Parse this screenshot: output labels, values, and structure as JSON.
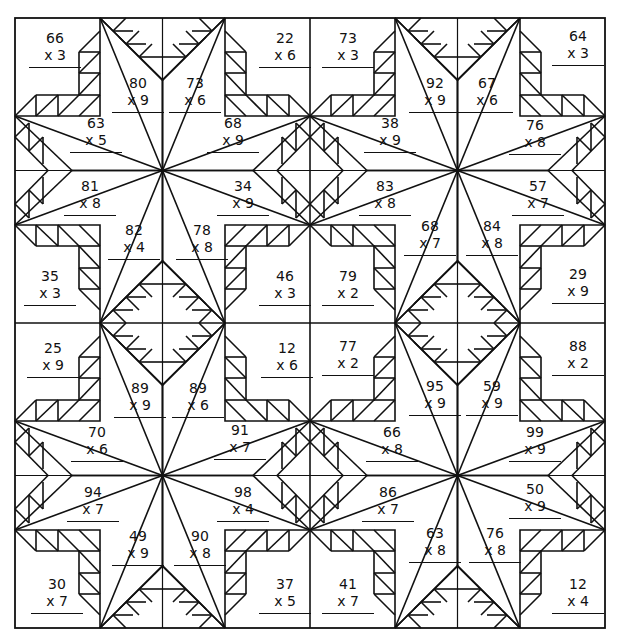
{
  "worksheet": {
    "type": "multiplication color-by-number quilt",
    "problems": [
      {
        "id": "q1-a",
        "n": "66",
        "m": "x 3",
        "x": 25,
        "y": 30
      },
      {
        "id": "q1-b",
        "n": "80",
        "m": "x 9",
        "x": 108,
        "y": 75
      },
      {
        "id": "q1-c",
        "n": "73",
        "m": "x 6",
        "x": 165,
        "y": 75
      },
      {
        "id": "q1-d",
        "n": "22",
        "m": "x 6",
        "x": 255,
        "y": 30
      },
      {
        "id": "q1-e",
        "n": "63",
        "m": "x 5",
        "x": 66,
        "y": 115
      },
      {
        "id": "q1-f",
        "n": "68",
        "m": "x 9",
        "x": 203,
        "y": 115
      },
      {
        "id": "q1-g",
        "n": "81",
        "m": "x 8",
        "x": 60,
        "y": 178
      },
      {
        "id": "q1-h",
        "n": "34",
        "m": "x 9",
        "x": 213,
        "y": 178
      },
      {
        "id": "q1-i",
        "n": "82",
        "m": "x 4",
        "x": 104,
        "y": 222
      },
      {
        "id": "q1-j",
        "n": "78",
        "m": "x 8",
        "x": 172,
        "y": 222
      },
      {
        "id": "q1-k",
        "n": "35",
        "m": "x 3",
        "x": 20,
        "y": 268
      },
      {
        "id": "q1-l",
        "n": "46",
        "m": "x 3",
        "x": 255,
        "y": 268
      },
      {
        "id": "q2-a",
        "n": "73",
        "m": "x 3",
        "x": 318,
        "y": 30
      },
      {
        "id": "q2-b",
        "n": "92",
        "m": "x 9",
        "x": 405,
        "y": 75
      },
      {
        "id": "q2-c",
        "n": "67",
        "m": "x 6",
        "x": 457,
        "y": 75
      },
      {
        "id": "q2-d",
        "n": "64",
        "m": "x 3",
        "x": 548,
        "y": 28
      },
      {
        "id": "q2-e",
        "n": "38",
        "m": "x 9",
        "x": 360,
        "y": 115
      },
      {
        "id": "q2-f",
        "n": "76",
        "m": "x 8",
        "x": 505,
        "y": 117
      },
      {
        "id": "q2-g",
        "n": "83",
        "m": "x 8",
        "x": 355,
        "y": 178
      },
      {
        "id": "q2-h",
        "n": "57",
        "m": "x 7",
        "x": 508,
        "y": 178
      },
      {
        "id": "q2-i",
        "n": "68",
        "m": "x 7",
        "x": 400,
        "y": 218
      },
      {
        "id": "q2-j",
        "n": "84",
        "m": "x 8",
        "x": 462,
        "y": 218
      },
      {
        "id": "q2-k",
        "n": "79",
        "m": "x 2",
        "x": 318,
        "y": 268
      },
      {
        "id": "q2-l",
        "n": "29",
        "m": "x 9",
        "x": 548,
        "y": 266
      },
      {
        "id": "q3-a",
        "n": "25",
        "m": "x 9",
        "x": 23,
        "y": 340
      },
      {
        "id": "q3-b",
        "n": "89",
        "m": "x 9",
        "x": 110,
        "y": 380
      },
      {
        "id": "q3-c",
        "n": "89",
        "m": "x 6",
        "x": 168,
        "y": 380
      },
      {
        "id": "q3-d",
        "n": "12",
        "m": "x 6",
        "x": 257,
        "y": 340
      },
      {
        "id": "q3-e",
        "n": "70",
        "m": "x 6",
        "x": 67,
        "y": 424
      },
      {
        "id": "q3-f",
        "n": "91",
        "m": "x 7",
        "x": 210,
        "y": 422
      },
      {
        "id": "q3-g",
        "n": "94",
        "m": "x 7",
        "x": 63,
        "y": 484
      },
      {
        "id": "q3-h",
        "n": "98",
        "m": "x 4",
        "x": 213,
        "y": 484
      },
      {
        "id": "q3-i",
        "n": "49",
        "m": "x 9",
        "x": 108,
        "y": 528
      },
      {
        "id": "q3-j",
        "n": "90",
        "m": "x 8",
        "x": 170,
        "y": 528
      },
      {
        "id": "q3-k",
        "n": "30",
        "m": "x 7",
        "x": 27,
        "y": 576
      },
      {
        "id": "q3-l",
        "n": "37",
        "m": "x 5",
        "x": 255,
        "y": 576
      },
      {
        "id": "q4-a",
        "n": "77",
        "m": "x 2",
        "x": 318,
        "y": 338
      },
      {
        "id": "q4-b",
        "n": "95",
        "m": "x 9",
        "x": 405,
        "y": 378
      },
      {
        "id": "q4-c",
        "n": "59",
        "m": "x 9",
        "x": 462,
        "y": 378
      },
      {
        "id": "q4-d",
        "n": "88",
        "m": "x 2",
        "x": 548,
        "y": 338
      },
      {
        "id": "q4-e",
        "n": "66",
        "m": "x 8",
        "x": 362,
        "y": 424
      },
      {
        "id": "q4-f",
        "n": "99",
        "m": "x 9",
        "x": 505,
        "y": 424
      },
      {
        "id": "q4-g",
        "n": "86",
        "m": "x 7",
        "x": 358,
        "y": 484
      },
      {
        "id": "q4-h",
        "n": "50",
        "m": "x 9",
        "x": 505,
        "y": 481
      },
      {
        "id": "q4-i",
        "n": "63",
        "m": "x 8",
        "x": 405,
        "y": 525
      },
      {
        "id": "q4-j",
        "n": "76",
        "m": "x 8",
        "x": 465,
        "y": 525
      },
      {
        "id": "q4-k",
        "n": "41",
        "m": "x 7",
        "x": 318,
        "y": 576
      },
      {
        "id": "q4-l",
        "n": "12",
        "m": "x 4",
        "x": 548,
        "y": 576
      }
    ]
  },
  "colors": {
    "line": "#111111",
    "background": "#ffffff"
  }
}
